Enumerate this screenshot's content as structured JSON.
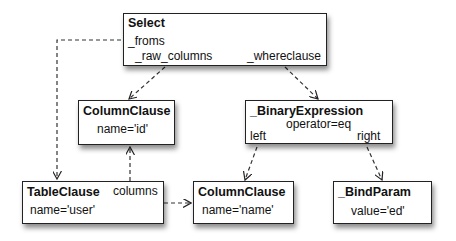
{
  "nodes": {
    "select": {
      "title": "Select",
      "froms": "_froms",
      "raw_columns": "_raw_columns",
      "whereclause": "_whereclause"
    },
    "column_id": {
      "title": "ColumnClause",
      "attr": "name='id'"
    },
    "binary": {
      "title": "_BinaryExpression",
      "attr": "operator=eq",
      "left": "left",
      "right": "right"
    },
    "table": {
      "title": "TableClause",
      "attr": "name='user'",
      "columns": "columns"
    },
    "column_name": {
      "title": "ColumnClause",
      "attr": "name='name'"
    },
    "bindparam": {
      "title": "_BindParam",
      "attr": "value='ed'"
    }
  },
  "edges": [
    {
      "from": "select._froms",
      "to": "table"
    },
    {
      "from": "select._raw_columns",
      "to": "column_id"
    },
    {
      "from": "select._whereclause",
      "to": "binary"
    },
    {
      "from": "table.columns",
      "to": "column_id"
    },
    {
      "from": "table",
      "to": "column_name"
    },
    {
      "from": "binary.left",
      "to": "column_name"
    },
    {
      "from": "binary.right",
      "to": "bindparam"
    }
  ],
  "colors": {
    "stroke": "#222222",
    "background": "#ffffff"
  }
}
